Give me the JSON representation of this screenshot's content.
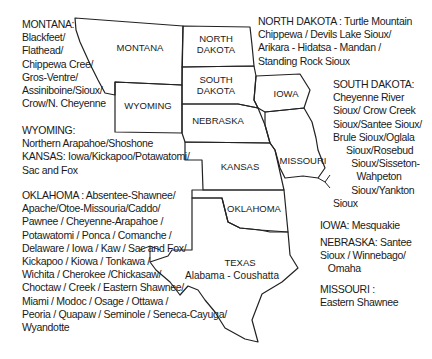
{
  "map": {
    "states": {
      "montana": "MONTANA",
      "north_dakota": "NORTH\nDAKOTA",
      "south_dakota": "SOUTH\nDAKOTA",
      "wyoming": "WYOMING",
      "nebraska": "NEBRASKA",
      "iowa": "IOWA",
      "kansas": "KANSAS",
      "missouri": "MISSOURI",
      "oklahoma": "OKLAHOMA",
      "texas": "TEXAS"
    },
    "texas_tribe": "Alabama - Coushatta"
  },
  "legend": {
    "montana": "MONTANA:\nBlackfeet/\nFlathead/\nChippewa Cree/\nGros-Ventre/\nAssiniboine/Sioux/\nCrow/N. Cheyenne",
    "wyoming_kansas": "WYOMING:\nNorthern Arapahoe/Shoshone\nKANSAS: Iowa/Kickapoo/Potawatomi/\nSac and Fox",
    "oklahoma": "OKLAHOMA : Absentee-Shawnee/\nApache/Otoe-Missouria/Caddo/\nPawnee / Cheyenne-Arapahoe /\nPotawatomi / Ponca / Comanche /\nDelaware / Iowa / Kaw / Sac and Fox/\nKickapoo / Kiowa / Tonkawa /\nWichita / Cherokee /Chickasaw/\nChoctaw / Creek / Eastern Shawnee/\nMiami / Modoc / Osage / Ottawa /\nPeoria / Quapaw / Seminole / Seneca-Cayuga/\nWyandotte",
    "north_dakota": "NORTH DAKOTA : Turtle Mountain\nChippewa / Devils Lake Sioux/\nArikara - Hidatsa - Mandan /\nStanding Rock Sioux",
    "south_dakota": "SOUTH DAKOTA:\nCheyenne River\nSioux/ Crow Creek\nSioux/Santee Sioux/\nBrule Sioux/Oglala\n     Sioux/Rosebud\n       Sioux/Sisseton-\n         Wahpeton\n       Sioux/Yankton\nSioux",
    "iowa": "IOWA: Mesquakie",
    "nebraska": "NEBRASKA: Santee\nSioux / Winnebago/\n   Omaha",
    "missouri": "MISSOURI :\nEastern Shawnee"
  }
}
